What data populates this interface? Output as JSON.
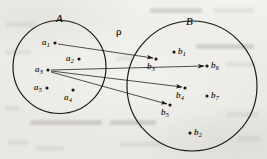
{
  "figure": {
    "type": "set-relation-diagram",
    "width": 267,
    "height": 159,
    "ink_color": "#17150f",
    "paper_color": "#efeeea"
  },
  "labels": {
    "set_a": "A",
    "set_b": "B",
    "relation": "ρ"
  },
  "label_positions": {
    "set_a": {
      "x": 56,
      "y": 13
    },
    "set_b": {
      "x": 186,
      "y": 16
    },
    "relation": {
      "x": 116,
      "y": 26
    }
  },
  "circles": [
    {
      "name": "circle-a",
      "label": "A",
      "cx": 59.5,
      "cy": 67,
      "r": 46.5
    },
    {
      "name": "circle-b",
      "label": "B",
      "cx": 192,
      "cy": 86,
      "r": 65
    }
  ],
  "points_a": [
    {
      "id": "a1",
      "base": "a",
      "sub": "1",
      "x": 55,
      "y": 43,
      "label_side": "left"
    },
    {
      "id": "a2",
      "base": "a",
      "sub": "2",
      "x": 79,
      "y": 59,
      "label_side": "left"
    },
    {
      "id": "a3",
      "base": "a",
      "sub": "3",
      "x": 48,
      "y": 70,
      "label_side": "left"
    },
    {
      "id": "a5",
      "base": "a",
      "sub": "5",
      "x": 47,
      "y": 88,
      "label_side": "left"
    },
    {
      "id": "a4",
      "base": "a",
      "sub": "4",
      "x": 73,
      "y": 90,
      "label_side": "below"
    }
  ],
  "points_b": [
    {
      "id": "b3",
      "base": "b",
      "sub": "3",
      "x": 156,
      "y": 59,
      "label_side": "below"
    },
    {
      "id": "b1",
      "base": "b",
      "sub": "1",
      "x": 174,
      "y": 52,
      "label_side": "right"
    },
    {
      "id": "b6",
      "base": "b",
      "sub": "6",
      "x": 207,
      "y": 66,
      "label_side": "right"
    },
    {
      "id": "b4",
      "base": "b",
      "sub": "4",
      "x": 185,
      "y": 88,
      "label_side": "below"
    },
    {
      "id": "b7",
      "base": "b",
      "sub": "7",
      "x": 207,
      "y": 96,
      "label_side": "right"
    },
    {
      "id": "b5",
      "base": "b",
      "sub": "5",
      "x": 170,
      "y": 105,
      "label_side": "below"
    },
    {
      "id": "b2",
      "base": "b",
      "sub": "2",
      "x": 190,
      "y": 133,
      "label_side": "right"
    }
  ],
  "arrows": [
    {
      "id": "a1-to-b3",
      "from": "a1",
      "to": "b3",
      "x1": 58,
      "y1": 44,
      "x2": 153,
      "y2": 58
    },
    {
      "id": "a3-to-b6",
      "from": "a3",
      "to": "b6",
      "x1": 51,
      "y1": 70,
      "x2": 204,
      "y2": 66
    },
    {
      "id": "a3-to-b4",
      "from": "a3",
      "to": "b4",
      "x1": 51,
      "y1": 71,
      "x2": 182,
      "y2": 87
    },
    {
      "id": "a3-to-b5",
      "from": "a3",
      "to": "b5",
      "x1": 51,
      "y1": 72,
      "x2": 167,
      "y2": 104
    }
  ],
  "bleed_rows": [
    {
      "x": 6,
      "y": 22,
      "w": 30,
      "t": "light"
    },
    {
      "x": 150,
      "y": 8,
      "w": 52,
      "t": "dark"
    },
    {
      "x": 214,
      "y": 8,
      "w": 40,
      "t": "light"
    },
    {
      "x": 5,
      "y": 50,
      "w": 26,
      "t": "light"
    },
    {
      "x": 196,
      "y": 44,
      "w": 58,
      "t": "dark"
    },
    {
      "x": 116,
      "y": 56,
      "w": 18,
      "t": "light"
    },
    {
      "x": 226,
      "y": 62,
      "w": 30,
      "t": "light"
    },
    {
      "x": 5,
      "y": 106,
      "w": 14,
      "t": "light"
    },
    {
      "x": 30,
      "y": 120,
      "w": 72,
      "t": "dark"
    },
    {
      "x": 110,
      "y": 120,
      "w": 46,
      "t": "dark"
    },
    {
      "x": 226,
      "y": 112,
      "w": 32,
      "t": "light"
    },
    {
      "x": 8,
      "y": 140,
      "w": 20,
      "t": "light"
    },
    {
      "x": 36,
      "y": 146,
      "w": 28,
      "t": "light"
    },
    {
      "x": 120,
      "y": 142,
      "w": 44,
      "t": "light"
    },
    {
      "x": 238,
      "y": 136,
      "w": 22,
      "t": "light"
    }
  ]
}
